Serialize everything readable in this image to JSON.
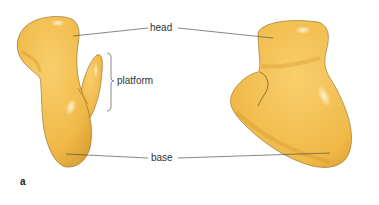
{
  "figure": {
    "panel_label": "a",
    "labels": {
      "head": "head",
      "platform": "platform",
      "base": "base"
    },
    "colors": {
      "surface": "#f2bd4e",
      "surface_shadow": "#d9a032",
      "surface_highlight": "#fbe3a4",
      "outline": "#8a6a2a",
      "leader_line": "#555555",
      "text": "#333333"
    },
    "views": [
      {
        "name": "left-view",
        "regions": [
          "head",
          "platform",
          "base"
        ]
      },
      {
        "name": "right-view",
        "regions": [
          "head",
          "base"
        ]
      }
    ]
  }
}
